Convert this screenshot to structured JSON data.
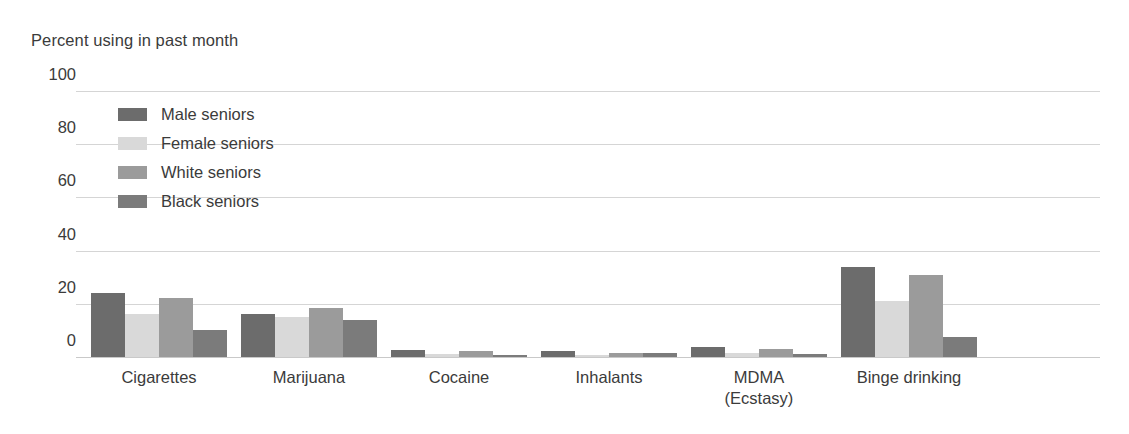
{
  "chart_data": {
    "type": "bar",
    "title": "Percent using in past month",
    "xlabel": "",
    "ylabel": "Percent using in past month",
    "ylim": [
      0,
      100
    ],
    "yticks": [
      0,
      20,
      40,
      60,
      80,
      100
    ],
    "ytick_labels": [
      "0",
      "20",
      "40",
      "60",
      "80",
      "100"
    ],
    "grid": true,
    "legend_position": "upper left inside",
    "categories": [
      "Cigarettes",
      "Marijuana",
      "Cocaine",
      "Inhalants",
      "MDMA\n(Ecstasy)",
      "Binge drinking"
    ],
    "category_lines": [
      [
        "Cigarettes"
      ],
      [
        "Marijuana"
      ],
      [
        "Cocaine"
      ],
      [
        "Inhalants"
      ],
      [
        "MDMA",
        "(Ecstasy)"
      ],
      [
        "Binge drinking"
      ]
    ],
    "series": [
      {
        "name": "Male seniors",
        "color": "#6c6c6c",
        "values": [
          24,
          16,
          2.6,
          2.2,
          3.6,
          34
        ]
      },
      {
        "name": "Female seniors",
        "color": "#d9d9d9",
        "values": [
          16,
          15,
          1.0,
          0.7,
          1.6,
          21
        ]
      },
      {
        "name": "White seniors",
        "color": "#9b9b9b",
        "values": [
          22,
          18.5,
          2.2,
          1.4,
          3.0,
          31
        ]
      },
      {
        "name": "Black seniors",
        "color": "#7b7b7b",
        "values": [
          10,
          14,
          0.8,
          1.5,
          1.1,
          7.5
        ]
      }
    ]
  },
  "legend": {
    "items": [
      {
        "label": "Male seniors",
        "color": "#6c6c6c"
      },
      {
        "label": "Female seniors",
        "color": "#d9d9d9"
      },
      {
        "label": "White seniors",
        "color": "#9b9b9b"
      },
      {
        "label": "Black seniors",
        "color": "#7b7b7b"
      }
    ]
  }
}
